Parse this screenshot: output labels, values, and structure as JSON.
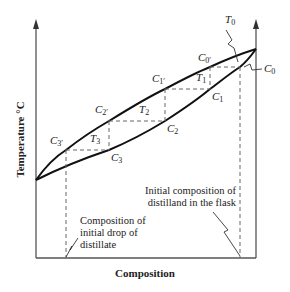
{
  "diagram": {
    "axes": {
      "x_label": "Composition",
      "y_label": "Temperature °C"
    },
    "points": {
      "T0": {
        "sym": "T",
        "sub": "0"
      },
      "C0": {
        "sym": "C",
        "sub": "0"
      },
      "C0p": {
        "sym": "C",
        "sub": "0′"
      },
      "T1": {
        "sym": "T",
        "sub": "1"
      },
      "C1": {
        "sym": "C",
        "sub": "1"
      },
      "C1p": {
        "sym": "C",
        "sub": "1′"
      },
      "T2": {
        "sym": "T",
        "sub": "2"
      },
      "C2": {
        "sym": "C",
        "sub": "2"
      },
      "C2p": {
        "sym": "C",
        "sub": "2′"
      },
      "T3": {
        "sym": "T",
        "sub": "3"
      },
      "C3": {
        "sym": "C",
        "sub": "3"
      },
      "C3p": {
        "sym": "C",
        "sub": "3′"
      }
    },
    "annotations": {
      "initial_composition_line1": "Initial composition of",
      "initial_composition_line2": "distilland in the flask",
      "initial_drop_line1": "Composition of",
      "initial_drop_line2": "initial drop of",
      "initial_drop_line3": "distillate"
    },
    "colors": {
      "curve": "#111111",
      "axis": "#555555",
      "dashed": "#666666",
      "text": "#222222"
    }
  }
}
